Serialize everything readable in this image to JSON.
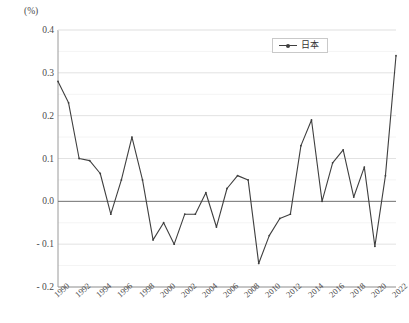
{
  "chart_data": {
    "type": "line",
    "title": "",
    "subtitle": "",
    "xlabel": "",
    "ylabel": "",
    "unit_label": "(%)",
    "ylim": [
      -0.2,
      0.4
    ],
    "y_ticks": [
      "0.4",
      "0.3",
      "0.2",
      "0.1",
      "0.0",
      "- 0.1",
      "- 0.2"
    ],
    "y_tick_values": [
      0.4,
      0.3,
      0.2,
      0.1,
      0.0,
      -0.1,
      -0.2
    ],
    "grid": true,
    "grid_axis": "y",
    "zero_line": true,
    "legend": {
      "position": "top-right",
      "entries": [
        "日本"
      ]
    },
    "x_tick_labels": [
      "1990",
      "1992",
      "1994",
      "1996",
      "1998",
      "2000",
      "2002",
      "2004",
      "2006",
      "2008",
      "2010",
      "2012",
      "2014",
      "2016",
      "2018",
      "2020",
      "2022"
    ],
    "x": [
      1990,
      1991,
      1992,
      1993,
      1994,
      1995,
      1996,
      1997,
      1998,
      1999,
      2000,
      2001,
      2002,
      2003,
      2004,
      2005,
      2006,
      2007,
      2008,
      2009,
      2010,
      2011,
      2012,
      2013,
      2014,
      2015,
      2016,
      2017,
      2018,
      2019,
      2020,
      2021,
      2022
    ],
    "xlim": [
      1990,
      2022
    ],
    "series": [
      {
        "name": "日本",
        "color": "#3f3f3f",
        "marker": "dot",
        "values": [
          0.28,
          0.23,
          0.1,
          0.095,
          0.065,
          -0.03,
          0.05,
          0.15,
          0.05,
          -0.09,
          -0.05,
          -0.1,
          -0.03,
          -0.03,
          0.02,
          -0.06,
          0.03,
          0.06,
          0.05,
          -0.145,
          -0.08,
          -0.04,
          -0.03,
          0.13,
          0.19,
          0.0,
          0.09,
          0.12,
          0.01,
          0.08,
          -0.105,
          0.06,
          0.34
        ]
      }
    ]
  },
  "colors": {
    "series": "#3f3f3f",
    "grid": "#e2e2e2",
    "axis": "#9a9a9a",
    "zero_line": "#6f6f6f",
    "text": "#4a4a4a",
    "background": "#ffffff"
  }
}
